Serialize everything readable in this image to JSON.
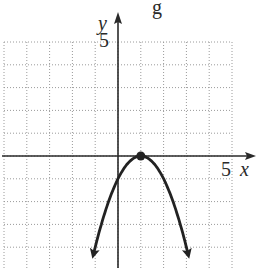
{
  "header": {
    "cropped_text_fragment": "g"
  },
  "chart_data": {
    "type": "line",
    "title": "",
    "xlabel": "x",
    "ylabel": "y",
    "xlim": [
      -5,
      5
    ],
    "ylim": [
      -4.9,
      5
    ],
    "grid": true,
    "grid_style": "dotted",
    "grid_step": 1,
    "tick_labels": {
      "x": [
        "5"
      ],
      "y": [
        "5"
      ]
    },
    "series": [
      {
        "name": "y = -(x-1)^2",
        "equation": "y = -(x - 1)^2",
        "points": [
          [
            -1.05,
            -4.2
          ],
          [
            -0.5,
            -2.25
          ],
          [
            0,
            -1
          ],
          [
            0.5,
            -0.25
          ],
          [
            1,
            0
          ],
          [
            1.5,
            -0.25
          ],
          [
            2,
            -1
          ],
          [
            2.5,
            -2.25
          ],
          [
            3.05,
            -4.2
          ]
        ],
        "arrows_on_ends": true,
        "marked_points": [
          {
            "x": 1,
            "y": 0,
            "label": "vertex"
          }
        ]
      }
    ],
    "legend": null
  },
  "colors": {
    "axis": "#2a2a2a",
    "curve": "#222222",
    "grid": "#9a9a9a",
    "background": "#ffffff"
  },
  "labels": {
    "x_axis": "x",
    "y_axis": "y",
    "x_tick": "5",
    "y_tick": "5",
    "top_fragment": "g"
  }
}
